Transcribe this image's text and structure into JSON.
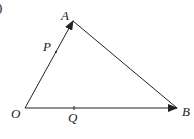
{
  "diagram": {
    "type": "vector-triangle",
    "corner_mark": ")",
    "points": {
      "O": {
        "label": "O",
        "x": 25,
        "y": 108
      },
      "A": {
        "label": "A",
        "x": 73,
        "y": 21
      },
      "B": {
        "label": "B",
        "x": 177,
        "y": 108
      },
      "P": {
        "label": "P",
        "x": 56,
        "y": 52
      },
      "Q": {
        "label": "Q",
        "x": 74,
        "y": 108
      }
    },
    "edges": [
      {
        "from": "O",
        "to": "A",
        "arrow": true
      },
      {
        "from": "O",
        "to": "B",
        "arrow": true
      },
      {
        "from": "A",
        "to": "B",
        "arrow": false
      }
    ],
    "stroke_color": "#222222"
  }
}
